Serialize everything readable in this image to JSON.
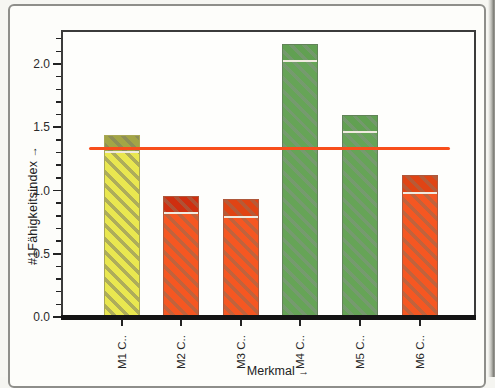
{
  "window": {
    "background": "#f5f5f1",
    "card_border": "#8e8e8a"
  },
  "chart_data": {
    "type": "bar",
    "title": "",
    "ylabel": "#1Fähigkeitsindex",
    "xlabel": "Merkmal",
    "axis_arrow": "→",
    "categories": [
      "M1 C..",
      "M2 C..",
      "M3 C..",
      "M4 C..",
      "M5 C..",
      "M6 C.."
    ],
    "values": [
      1.44,
      0.96,
      0.93,
      2.16,
      1.6,
      1.12
    ],
    "ylim": [
      0,
      2.27
    ],
    "yticks": [
      0.0,
      0.5,
      1.0,
      1.5,
      2.0
    ],
    "minor_tick_step": 0.1,
    "minor_tick_max": 2.2,
    "grid": false,
    "legend": null,
    "reference_line": {
      "value": 1.33,
      "color": "#f84e1b"
    },
    "bar_styles": [
      {
        "body": "#e9e750",
        "cap": "#a3a546",
        "hatch": "rgba(125,125,100,0.55)"
      },
      {
        "body": "#f55722",
        "cap": "#cf2f10",
        "hatch": "rgba(150,108,82,0.55)"
      },
      {
        "body": "#f55722",
        "cap": "#e04414",
        "hatch": "rgba(150,108,82,0.55)"
      },
      {
        "body": "#66a457",
        "cap": "#61a052",
        "hatch": "rgba(128,148,126,0.6)"
      },
      {
        "body": "#66a457",
        "cap": "#61a052",
        "hatch": "rgba(128,148,126,0.6)"
      },
      {
        "body": "#f55722",
        "cap": "#e04414",
        "hatch": "rgba(150,108,82,0.55)"
      }
    ],
    "cap_height_units": 0.12,
    "separator_color": "#efeadf"
  }
}
